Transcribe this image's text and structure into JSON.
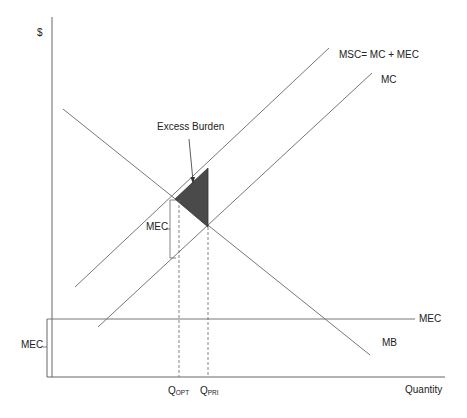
{
  "diagram": {
    "y_axis_label": "$",
    "x_axis_label": "Quantity",
    "curves": [
      {
        "name": "MSC",
        "label": "MSC= MC + MEC"
      },
      {
        "name": "MC",
        "label": "MC"
      },
      {
        "name": "MB",
        "label": "MB"
      },
      {
        "name": "MEC",
        "label": "MEC"
      }
    ],
    "annotations": {
      "excess_burden": "Excess Burden",
      "mec_gap": "MEC",
      "mec_axis": "MEC"
    },
    "quantities": {
      "opt_main": "Q",
      "opt_sub": "OPT",
      "pri_main": "Q",
      "pri_sub": "PRI"
    },
    "colors": {
      "line": "#555555",
      "shade": "#4a4a4a",
      "text": "#222222"
    }
  }
}
